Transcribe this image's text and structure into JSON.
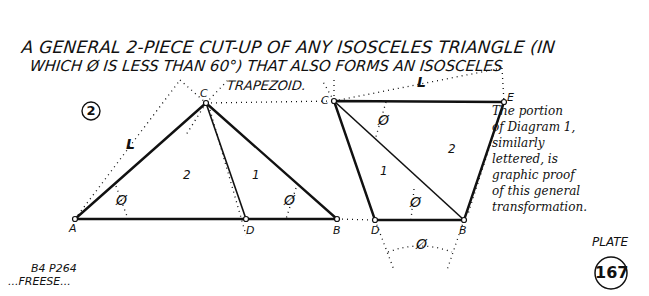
{
  "title": {
    "line1": "A GENERAL 2-PIECE CUT-UP OF ANY ISOSCELES TRIANGLE (IN",
    "line2": "WHICH Ø IS LESS THAN 60°) THAT ALSO FORMS AN ISOSCELES",
    "line3": "TRAPEZOID."
  },
  "diagram_number": "2",
  "triangle": {
    "vertices": {
      "A": "A",
      "C": "C",
      "D": "D",
      "B": "B"
    },
    "pieces": [
      "2",
      "1"
    ],
    "side_label": "L",
    "angle_label": "Ø"
  },
  "trapezoid": {
    "vertices": {
      "C": "C",
      "E": "E",
      "D": "D",
      "B": "B"
    },
    "pieces": [
      "1",
      "2"
    ],
    "side_label": "L",
    "angle_label": "Ø"
  },
  "caption": "The portion\nof Diagram 1,\nsimilarly\nlettered, is\ngraphic proof\nof this general\ntransformation.",
  "plate": {
    "label": "PLATE",
    "number": "167"
  },
  "footer": {
    "line1": "B4 P264",
    "line2": "...FREESE..."
  }
}
